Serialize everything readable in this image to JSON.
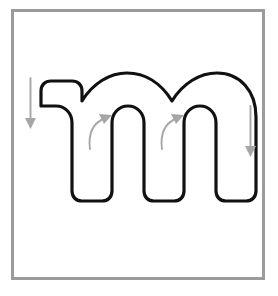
{
  "worksheet": {
    "title": "Lowercase letter m stroke-order tracing diagram",
    "background_color": "#ffffff",
    "frame": {
      "label": "letter-frame",
      "border_color": "#9b9b9b",
      "border_width_px": 3,
      "fill_color": "#ffffff",
      "x": 11,
      "y": 9,
      "width": 254,
      "height": 271
    },
    "letter": {
      "character": "m",
      "case": "lowercase",
      "outline_color": "#111111",
      "fill_color": "#ffffff",
      "outline_width_px": 3
    },
    "arrows": [
      {
        "name": "down-arrow-left-stem",
        "direction": "down",
        "shape": "straight",
        "color": "#a6a6a6",
        "start_x": 30,
        "start_y": 78,
        "end_x": 30,
        "end_y": 128
      },
      {
        "name": "curved-arrow-first-arch",
        "direction": "up-right",
        "shape": "curved",
        "color": "#a6a6a6",
        "start_x": 90,
        "start_y": 148,
        "end_x": 110,
        "end_y": 117
      },
      {
        "name": "curved-arrow-second-arch",
        "direction": "up-right",
        "shape": "curved",
        "color": "#a6a6a6",
        "start_x": 168,
        "start_y": 148,
        "end_x": 188,
        "end_y": 117
      },
      {
        "name": "down-arrow-right-stem",
        "direction": "down",
        "shape": "straight",
        "color": "#a6a6a6",
        "start_x": 250,
        "start_y": 106,
        "end_x": 250,
        "end_y": 157
      }
    ]
  }
}
